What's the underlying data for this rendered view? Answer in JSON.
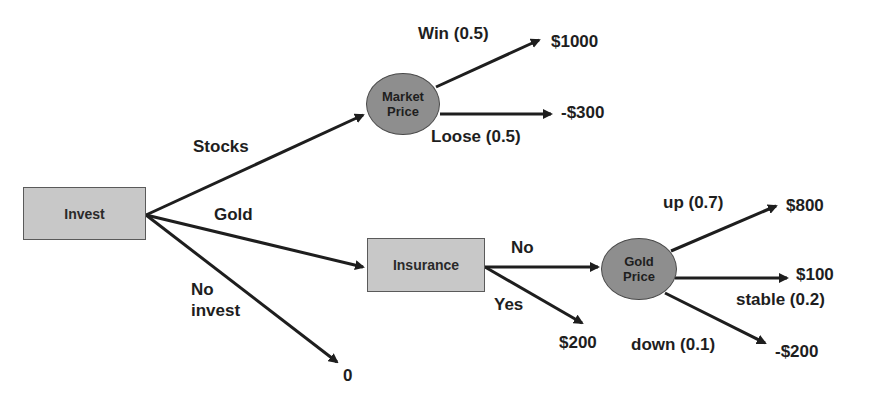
{
  "nodes": {
    "invest": {
      "label": "Invest",
      "type": "decision"
    },
    "market_price": {
      "line1": "Market",
      "line2": "Price",
      "type": "chance"
    },
    "insurance": {
      "label": "Insurance",
      "type": "decision"
    },
    "gold_price": {
      "line1": "Gold",
      "line2": "Price",
      "type": "chance"
    }
  },
  "edges": {
    "stocks": "Stocks",
    "gold": "Gold",
    "no_invest_line1": "No",
    "no_invest_line2": "invest",
    "win": "Win (0.5)",
    "loose": "Loose (0.5)",
    "insurance_no": "No",
    "insurance_yes": "Yes",
    "up": "up (0.7)",
    "stable": "stable (0.2)",
    "down": "down (0.1)"
  },
  "outcomes": {
    "win_value": "$1000",
    "loose_value": "-$300",
    "no_invest_value": "0",
    "insurance_yes_value": "$200",
    "up_value": "$800",
    "stable_value": "$100",
    "down_value": "-$200"
  },
  "colors": {
    "decision_fill": "#c8c8c8",
    "chance_fill": "#8e8e8e",
    "line": "#1e1e1e"
  }
}
